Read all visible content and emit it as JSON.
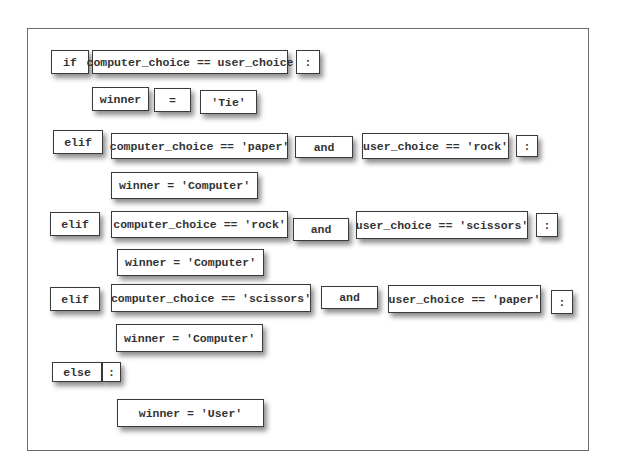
{
  "diagram": {
    "type": "code-magnet-tiles",
    "rows": [
      {
        "tiles": [
          "if",
          "computer_choice == user_choice",
          ":"
        ]
      },
      {
        "tiles": [
          "winner",
          "=",
          "'Tie'"
        ]
      },
      {
        "tiles": [
          "elif",
          "computer_choice == 'paper'",
          "and",
          "user_choice == 'rock'",
          ":"
        ]
      },
      {
        "tiles": [
          "winner = 'Computer'"
        ]
      },
      {
        "tiles": [
          "elif",
          "computer_choice == 'rock'",
          "and",
          "user_choice == 'scissors'",
          ":"
        ]
      },
      {
        "tiles": [
          "winner = 'Computer'"
        ]
      },
      {
        "tiles": [
          "elif",
          "computer_choice == 'scissors'",
          "and",
          "user_choice == 'paper'",
          ":"
        ]
      },
      {
        "tiles": [
          "winner = 'Computer'"
        ]
      },
      {
        "tiles": [
          "else",
          ":"
        ]
      },
      {
        "tiles": [
          "winner = 'User'"
        ]
      }
    ]
  }
}
